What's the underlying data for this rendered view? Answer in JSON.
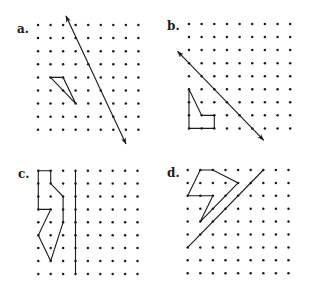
{
  "figure": {
    "colors": {
      "ink": "#1a1a1a",
      "background": "#ffffff"
    },
    "panels": [
      {
        "id": "a",
        "label": "a.",
        "label_pos": [
          17,
          33
        ],
        "grid": {
          "cols": 9,
          "rows": 9,
          "origin": [
            38,
            25
          ],
          "spacing": [
            12.55,
            13.1
          ]
        },
        "lines": [
          {
            "name": "reflection-line",
            "from": [
              2.23,
              -0.69
            ],
            "to": [
              7.01,
              9.08
            ],
            "arrows": "both"
          }
        ],
        "polygons": [
          {
            "name": "triangle",
            "points": [
              [
                1,
                4
              ],
              [
                2,
                4
              ],
              [
                3,
                6
              ]
            ]
          }
        ]
      },
      {
        "id": "b",
        "label": "b.",
        "label_pos": [
          167,
          30
        ],
        "grid": {
          "cols": 9,
          "rows": 9,
          "origin": [
            189,
            24
          ],
          "spacing": [
            12.65,
            13.05
          ]
        },
        "lines": [
          {
            "name": "reflection-line",
            "from": [
              -0.9,
              2.1
            ],
            "to": [
              5.9,
              8.9
            ],
            "arrows": "both"
          }
        ],
        "polygons": [
          {
            "name": "pentagon",
            "points": [
              [
                0,
                5
              ],
              [
                1,
                7
              ],
              [
                2,
                7
              ],
              [
                2,
                8
              ],
              [
                0,
                8
              ]
            ]
          }
        ]
      },
      {
        "id": "c",
        "label": "c.",
        "label_pos": [
          18,
          178
        ],
        "grid": {
          "cols": 9,
          "rows": 9,
          "origin": [
            38.3,
            170.7
          ],
          "spacing": [
            12.4,
            12.9
          ]
        },
        "lines": [
          {
            "name": "reflection-line",
            "from": [
              3,
              0
            ],
            "to": [
              3,
              8
            ],
            "arrows": "none"
          }
        ],
        "polygons": [
          {
            "name": "irregular-polygon",
            "points": [
              [
                0,
                0
              ],
              [
                1,
                0
              ],
              [
                1,
                1
              ],
              [
                2,
                2
              ],
              [
                2,
                4
              ],
              [
                1,
                7
              ],
              [
                0,
                5
              ],
              [
                1,
                3
              ],
              [
                0,
                3
              ]
            ]
          }
        ]
      },
      {
        "id": "d",
        "label": "d.",
        "label_pos": [
          167,
          177
        ],
        "grid": {
          "cols": 9,
          "rows": 9,
          "origin": [
            187.7,
            170
          ],
          "spacing": [
            12.6,
            12.9
          ]
        },
        "lines": [
          {
            "name": "reflection-line",
            "from": [
              0,
              6
            ],
            "to": [
              6,
              0
            ],
            "arrows": "none"
          }
        ],
        "polygons": [
          {
            "name": "irregular-polygon",
            "points": [
              [
                1,
                0
              ],
              [
                2,
                0
              ],
              [
                4,
                1
              ],
              [
                1,
                4
              ],
              [
                2,
                2
              ],
              [
                0,
                2
              ]
            ]
          }
        ]
      }
    ]
  }
}
